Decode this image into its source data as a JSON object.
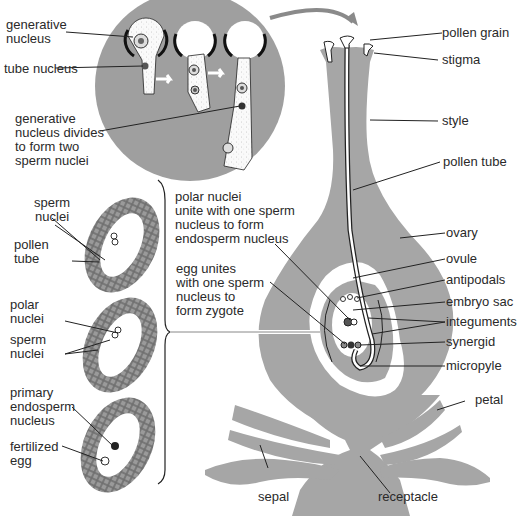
{
  "colors": {
    "tissue_gray": "#a6a6a6",
    "dark_circle": "#9e9e9e",
    "line": "#222222",
    "background": "#ffffff"
  },
  "inset_germination": {
    "labels": {
      "generative_nucleus": "generative\nnucleus",
      "tube_nucleus": "tube nucleus",
      "generative_divides": "generative\nnucleus divides\nto form two\nsperm nuclei"
    }
  },
  "ovule_stages": {
    "stage1": {
      "sperm_nuclei": "sperm\nnuclei",
      "pollen_tube": "pollen\ntube"
    },
    "stage2": {
      "polar_nuclei": "polar\nnuclei",
      "sperm_nuclei": "sperm\nnuclei"
    },
    "stage3": {
      "primary_endosperm": "primary\nendosperm\nnucleus",
      "fertilized_egg": "fertilized\negg"
    }
  },
  "center_text": {
    "polar_nuclei_unite": "polar nuclei\nunite with one sperm\nnucleus to form\nendosperm nucleus",
    "egg_unites": "egg unites\nwith one sperm\nnucleus to\nform zygote"
  },
  "flower_labels": {
    "pollen_grain": "pollen grain",
    "stigma": "stigma",
    "style": "style",
    "pollen_tube": "pollen tube",
    "ovary": "ovary",
    "ovule": "ovule",
    "antipodals": "antipodals",
    "embryo_sac": "embryo sac",
    "integuments": "integuments",
    "synergid": "synergid",
    "micropyle": "micropyle",
    "petal": "petal",
    "sepal": "sepal",
    "receptacle": "receptacle"
  }
}
